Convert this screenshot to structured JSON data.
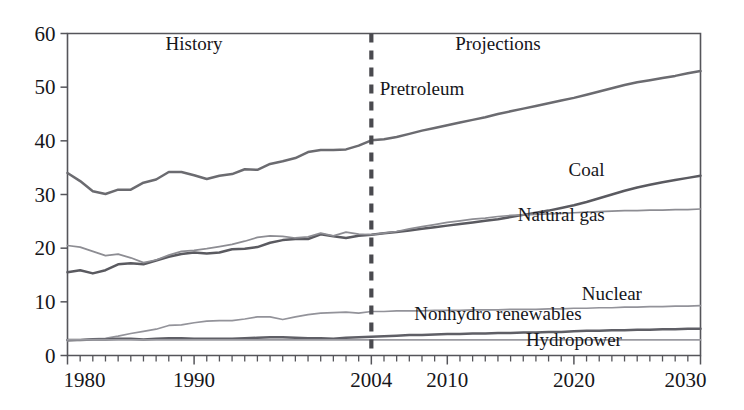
{
  "chart_data": {
    "type": "line",
    "title": "",
    "xlabel": "",
    "ylabel": "",
    "xlim": [
      1980,
      2030
    ],
    "ylim": [
      0,
      60
    ],
    "grid": false,
    "legend_position": "inline-right",
    "xticks": [
      1980,
      1990,
      2004,
      2010,
      2020,
      2030
    ],
    "xtick_labels": [
      "1980",
      "1990",
      "2004",
      "2010",
      "2020",
      "2030"
    ],
    "minor_xtick_interval": 1,
    "yticks": [
      0,
      10,
      20,
      30,
      40,
      50,
      60
    ],
    "ytick_labels": [
      "0",
      "10",
      "20",
      "30",
      "40",
      "50",
      "60"
    ],
    "annotations": [
      {
        "text": "History",
        "x": 1990,
        "y": 57
      },
      {
        "text": "Projections",
        "x": 2014,
        "y": 57
      }
    ],
    "divider": {
      "x": 2004,
      "style": "dashed",
      "label": "history-projection-divider"
    },
    "x": [
      1980,
      1981,
      1982,
      1983,
      1984,
      1985,
      1986,
      1987,
      1988,
      1989,
      1990,
      1991,
      1992,
      1993,
      1994,
      1995,
      1996,
      1997,
      1998,
      1999,
      2000,
      2001,
      2002,
      2003,
      2004,
      2005,
      2006,
      2007,
      2008,
      2009,
      2010,
      2011,
      2012,
      2013,
      2014,
      2015,
      2016,
      2017,
      2018,
      2019,
      2020,
      2021,
      2022,
      2023,
      2024,
      2025,
      2026,
      2027,
      2028,
      2029,
      2030
    ],
    "series": [
      {
        "name": "Pretroleum",
        "label": "Pretroleum",
        "color": "#6b6b70",
        "label_x": 2008,
        "label_y": 48.5,
        "values": [
          34.0,
          32.5,
          30.6,
          30.1,
          30.9,
          30.9,
          32.2,
          32.8,
          34.2,
          34.2,
          33.6,
          32.9,
          33.5,
          33.8,
          34.7,
          34.6,
          35.7,
          36.2,
          36.8,
          37.9,
          38.3,
          38.3,
          38.4,
          39.1,
          40.1,
          40.3,
          40.7,
          41.3,
          41.9,
          42.4,
          42.9,
          43.4,
          43.9,
          44.4,
          45.0,
          45.5,
          46.0,
          46.5,
          47.0,
          47.5,
          48.0,
          48.6,
          49.2,
          49.8,
          50.4,
          50.9,
          51.3,
          51.7,
          52.1,
          52.6,
          53.0
        ]
      },
      {
        "name": "Coal",
        "label": "Coal",
        "color": "#5a5a60",
        "label_x": 2021,
        "label_y": 33.5,
        "values": [
          15.5,
          15.9,
          15.3,
          15.9,
          17.0,
          17.2,
          17.0,
          17.7,
          18.4,
          18.9,
          19.2,
          19.0,
          19.2,
          19.8,
          19.9,
          20.2,
          21.0,
          21.5,
          21.7,
          21.7,
          22.6,
          22.2,
          21.9,
          22.3,
          22.5,
          22.8,
          23.0,
          23.3,
          23.6,
          23.9,
          24.2,
          24.5,
          24.8,
          25.1,
          25.4,
          25.8,
          26.2,
          26.6,
          27.0,
          27.5,
          28.0,
          28.6,
          29.3,
          30.0,
          30.7,
          31.3,
          31.8,
          32.3,
          32.7,
          33.1,
          33.5
        ]
      },
      {
        "name": "Natural gas",
        "label": "Natural gas",
        "color": "#8d8d93",
        "label_x": 2019,
        "label_y": 25.0,
        "values": [
          20.5,
          20.2,
          19.4,
          18.6,
          18.9,
          18.2,
          17.3,
          17.8,
          18.7,
          19.4,
          19.6,
          19.9,
          20.3,
          20.7,
          21.3,
          22.0,
          22.3,
          22.2,
          21.9,
          22.1,
          22.8,
          22.3,
          23.0,
          22.6,
          22.5,
          22.8,
          23.1,
          23.6,
          24.0,
          24.4,
          24.8,
          25.1,
          25.4,
          25.6,
          25.9,
          26.1,
          26.2,
          26.3,
          26.4,
          26.5,
          26.6,
          26.7,
          26.8,
          26.9,
          27.0,
          27.0,
          27.1,
          27.1,
          27.2,
          27.2,
          27.3
        ]
      },
      {
        "name": "Nuclear",
        "label": "Nuclear",
        "color": "#93939a",
        "label_x": 2023,
        "label_y": 10.3,
        "values": [
          2.7,
          2.9,
          3.1,
          3.2,
          3.6,
          4.1,
          4.5,
          4.9,
          5.6,
          5.7,
          6.1,
          6.4,
          6.5,
          6.5,
          6.8,
          7.2,
          7.2,
          6.7,
          7.2,
          7.6,
          7.9,
          8.0,
          8.1,
          7.9,
          8.2,
          8.2,
          8.3,
          8.3,
          8.3,
          8.4,
          8.4,
          8.4,
          8.5,
          8.5,
          8.5,
          8.6,
          8.6,
          8.6,
          8.7,
          8.7,
          8.8,
          8.8,
          8.9,
          8.9,
          9.0,
          9.0,
          9.1,
          9.1,
          9.2,
          9.2,
          9.3
        ]
      },
      {
        "name": "Nonhydro renewables",
        "label": "Nonhydro renewables",
        "color": "#5f5f66",
        "label_x": 2014,
        "label_y": 6.6,
        "values": [
          2.9,
          2.9,
          3.0,
          3.0,
          3.1,
          3.1,
          3.0,
          3.1,
          3.2,
          3.2,
          3.1,
          3.1,
          3.1,
          3.1,
          3.2,
          3.3,
          3.4,
          3.4,
          3.3,
          3.2,
          3.2,
          3.1,
          3.3,
          3.4,
          3.5,
          3.6,
          3.7,
          3.8,
          3.8,
          3.9,
          4.0,
          4.0,
          4.1,
          4.1,
          4.2,
          4.2,
          4.3,
          4.3,
          4.4,
          4.4,
          4.5,
          4.6,
          4.6,
          4.7,
          4.7,
          4.8,
          4.8,
          4.9,
          4.9,
          5.0,
          5.0
        ]
      },
      {
        "name": "Hydropower",
        "label": "Hydropower",
        "color": "#9a9aa0",
        "label_x": 2020,
        "label_y": 1.7,
        "values": [
          2.9,
          2.9,
          2.9,
          2.9,
          2.9,
          2.9,
          2.9,
          2.9,
          2.9,
          2.9,
          2.9,
          2.9,
          2.9,
          2.9,
          2.9,
          2.9,
          2.9,
          2.9,
          2.9,
          2.9,
          2.9,
          2.9,
          2.9,
          2.9,
          2.9,
          2.9,
          2.9,
          2.9,
          2.9,
          2.9,
          2.9,
          2.9,
          2.9,
          2.9,
          2.9,
          2.9,
          2.9,
          2.9,
          2.9,
          2.9,
          2.9,
          2.9,
          2.9,
          2.9,
          2.9,
          2.9,
          2.9,
          2.9,
          2.9,
          2.9,
          2.9
        ]
      }
    ]
  }
}
